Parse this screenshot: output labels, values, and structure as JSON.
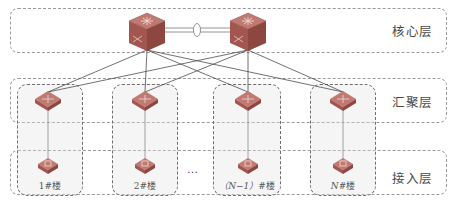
{
  "diagram": {
    "type": "network-topology",
    "layers": [
      {
        "id": "core",
        "label": "核心层"
      },
      {
        "id": "aggregation",
        "label": "汇聚层"
      },
      {
        "id": "access",
        "label": "接入层"
      }
    ],
    "core_switches": [
      "core-switch-1",
      "core-switch-2"
    ],
    "core_link": "stacked/aggregated link (ellipse marker)",
    "buildings": [
      {
        "label_prefix": "1",
        "label_suffix": "#楼"
      },
      {
        "label_prefix": "2",
        "label_suffix": "#楼"
      },
      {
        "label_prefix": "（N−1）",
        "label_suffix": "#楼"
      },
      {
        "label_prefix": "N",
        "label_suffix": "#楼"
      }
    ],
    "ellipsis": "…",
    "colors": {
      "switch_top": "#b86a63",
      "switch_side": "#8f4a45",
      "link": "#4a4a4a",
      "dash": "#8a8a8a"
    }
  }
}
